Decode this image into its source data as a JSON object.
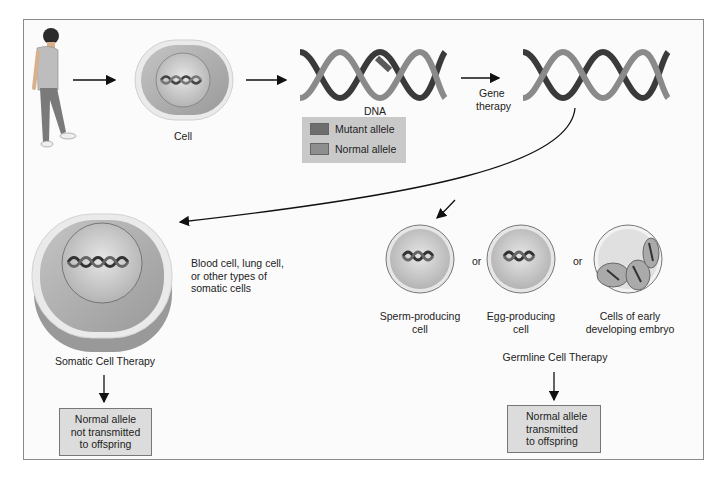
{
  "figure": {
    "labels": {
      "cell": "Cell",
      "dna": "DNA",
      "gene_therapy_line1": "Gene",
      "gene_therapy_line2": "therapy",
      "somatic_types_line1": "Blood cell, lung cell,",
      "somatic_types_line2": "or other types of",
      "somatic_types_line3": "somatic cells",
      "somatic_title": "Somatic Cell Therapy",
      "germline_title": "Germline Cell Therapy",
      "or1": "or",
      "or2": "or",
      "sperm_line1": "Sperm-producing",
      "sperm_line2": "cell",
      "egg_line1": "Egg-producing",
      "egg_line2": "cell",
      "embryo_line1": "Cells of early",
      "embryo_line2": "developing embryo"
    },
    "legend": {
      "items": [
        {
          "label": "Mutant allele",
          "color": "#6e6e6e"
        },
        {
          "label": "Normal allele",
          "color": "#8e8e8e"
        }
      ]
    },
    "outcomes": {
      "somatic_line1": "Normal allele",
      "somatic_line2": "not transmitted",
      "somatic_line3": "to offspring",
      "germline_line1": "Normal allele",
      "germline_line2": "transmitted",
      "germline_line3": "to offspring"
    }
  }
}
